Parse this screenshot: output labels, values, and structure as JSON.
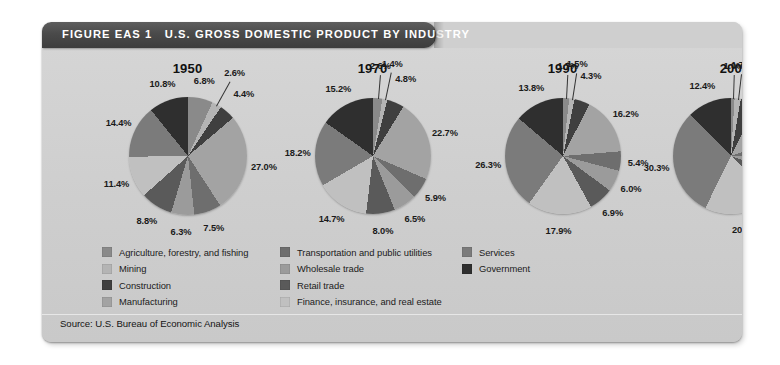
{
  "figure": {
    "label": "FIGURE EAS 1",
    "title": "U.S. GROSS DOMESTIC PRODUCT BY INDUSTRY",
    "source": "Source: U.S. Bureau of Economic Analysis",
    "panel_bg": "#d2d2d2",
    "titlebar_bg": "#4a4a4a",
    "titlebar_fg": "#ffffff"
  },
  "legend": {
    "columns": [
      {
        "items": [
          "Agriculture, forestry, and fishing",
          "Mining",
          "Construction",
          "Manufacturing"
        ]
      },
      {
        "items": [
          "Transportation and public utilities",
          "Wholesale trade",
          "Retail trade",
          "Finance, insurance, and real estate"
        ]
      },
      {
        "items": [
          "Services",
          "Government"
        ]
      }
    ]
  },
  "chart_data": {
    "type": "pie",
    "title": "U.S. Gross Domestic Product by Industry",
    "xlabel": "",
    "ylabel": "",
    "value_unit": "percent",
    "categories": [
      "Agriculture, forestry, and fishing",
      "Mining",
      "Construction",
      "Manufacturing",
      "Transportation and public utilities",
      "Wholesale trade",
      "Retail trade",
      "Finance, insurance, and real estate",
      "Services",
      "Government"
    ],
    "colors": [
      "#8a8a8a",
      "#b4b4b4",
      "#3f3f3f",
      "#a3a3a3",
      "#6e6e6e",
      "#9b9b9b",
      "#5a5a5a",
      "#c0c0c0",
      "#7b7b7b",
      "#2f2f2f"
    ],
    "charts": [
      {
        "title": "1950",
        "values": [
          6.8,
          2.6,
          4.4,
          27.0,
          7.5,
          6.3,
          8.8,
          11.4,
          14.4,
          10.8
        ],
        "labels": [
          "6.8%",
          "2.6%",
          "4.4%",
          "27.0%",
          "7.5%",
          "6.3%",
          "8.8%",
          "11.4%",
          "14.4%",
          "10.8%"
        ]
      },
      {
        "title": "1970",
        "values": [
          2.6,
          1.4,
          4.8,
          22.7,
          5.9,
          6.5,
          8.0,
          14.7,
          18.2,
          15.2
        ],
        "labels": [
          "2.6%",
          "1.4%",
          "4.8%",
          "22.7%",
          "5.9%",
          "6.5%",
          "8.0%",
          "14.7%",
          "18.2%",
          "15.2%"
        ]
      },
      {
        "title": "1990",
        "values": [
          1.7,
          1.5,
          4.3,
          16.2,
          5.4,
          6.0,
          6.9,
          17.9,
          26.3,
          13.8
        ],
        "labels": [
          "1.7%",
          "1.5%",
          "4.3%",
          "16.2%",
          "5.4%",
          "6.0%",
          "6.9%",
          "17.9%",
          "26.3%",
          "13.8%"
        ]
      },
      {
        "title": "2005",
        "values": [
          1.0,
          1.7,
          4.8,
          12.0,
          4.8,
          5.9,
          6.6,
          20.5,
          30.3,
          12.4
        ],
        "labels": [
          "1.0%",
          "1.7%",
          "4.8%",
          "12.0%",
          "4.8%",
          "5.9%",
          "6.6%",
          "20.5%",
          "30.3%",
          "12.4%"
        ]
      }
    ]
  }
}
